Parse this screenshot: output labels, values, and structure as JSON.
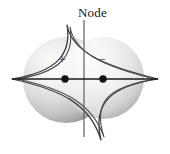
{
  "figure": {
    "title": "Node",
    "type": "orbital-phase-diagram",
    "background_color": "#ffffff",
    "width": 170,
    "height": 154,
    "labels": {
      "node": "Node",
      "positive_lobe": "+",
      "negative_lobe": "−"
    },
    "colors": {
      "outline": "#333333",
      "axis": "#1a1a1a",
      "node_line": "#555555",
      "sphere_light": "#f4f4f4",
      "sphere_mid": "#d8d8d8",
      "sphere_dark": "#9a9a9a",
      "nucleus": "#111111",
      "text": "#161616"
    },
    "geometry": {
      "left_sphere": {
        "cx": 66,
        "cy": 80,
        "r": 43
      },
      "right_sphere": {
        "cx": 103,
        "cy": 78,
        "r": 41
      },
      "node_line": {
        "x": 84,
        "y_top": 20,
        "y_bottom": 137
      },
      "axis_line": {
        "y": 79,
        "x_start": 12,
        "x_end": 158
      },
      "nuclei": [
        {
          "cx": 65,
          "cy": 79,
          "r": 3.6
        },
        {
          "cx": 103,
          "cy": 79,
          "r": 3.6
        }
      ],
      "star_cusps": {
        "top": {
          "x": 67,
          "y": 25
        },
        "bottom": {
          "x": 101,
          "y": 140
        },
        "left": {
          "x": 12,
          "y": 79
        },
        "right": {
          "x": 158,
          "y": 79
        }
      }
    }
  }
}
